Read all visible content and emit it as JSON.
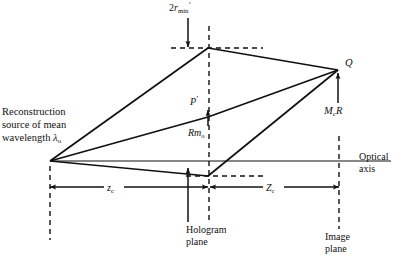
{
  "figure": {
    "kind": "optical-ray-diagram",
    "background_color": "#ffffff",
    "line_color": "#101010",
    "text_color": "#101010"
  },
  "labels": {
    "resolution_limit": {
      "name": "2r_min'",
      "prefix": "2",
      "symbol": "r",
      "subscript": "min",
      "prime": "′"
    },
    "source": {
      "line1": "Reconstruction",
      "line2": "source of mean",
      "line3_prefix": "wavelength ",
      "line3_symbol": "λ",
      "line3_subscript": "o"
    },
    "point_p_prime": {
      "symbol": "P",
      "prime": "′"
    },
    "rm_zero": {
      "symbol": "R",
      "symbol2": "m",
      "subscript": "o"
    },
    "point_q": {
      "symbol": "Q"
    },
    "mcr": {
      "symbol": "M",
      "subscript": "c",
      "symbol2": "R"
    },
    "distance_zc_small": {
      "symbol": "z",
      "subscript": "c"
    },
    "distance_zc_large": {
      "symbol": "Z",
      "subscript": "c"
    },
    "optical_axis": {
      "line1": "Optical",
      "line2": "axis"
    },
    "hologram_plane": {
      "line1": "Hologram",
      "line2": "plane"
    },
    "image_plane": {
      "line1": "Image",
      "line2": "plane"
    }
  },
  "geometry": {
    "source_point": {
      "x": 50,
      "y": 161
    },
    "top_vertex": {
      "x": 208,
      "y": 48
    },
    "mid_vertex": {
      "x": 208,
      "y": 117
    },
    "lower_vertex": {
      "x": 208,
      "y": 176
    },
    "q_point": {
      "x": 338,
      "y": 70
    },
    "optical_axis_y": 161,
    "optical_axis_x_start": 50,
    "optical_axis_x_end": 391,
    "vertical_source_x": 50,
    "vertical_hologram_x": 209,
    "vertical_image_x": 339,
    "dimension_line_y": 187
  }
}
